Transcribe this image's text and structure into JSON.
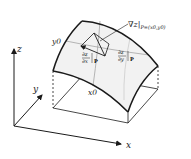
{
  "diagram": {
    "axes": {
      "x_label": "x",
      "y_label": "y",
      "z_label": "z"
    },
    "surface_labels": {
      "x0": "x0",
      "y0": "y0"
    },
    "annotations": {
      "gradient": "∇z|",
      "gradient_subscript": "P=(x0,y0)",
      "dzdx_num": "∂z",
      "dzdx_den": "∂x",
      "dzdy_num": "∂z",
      "dzdy_den": "∂y",
      "eval_at": "P"
    },
    "colors": {
      "line": "#1a1a1a",
      "surface_fill": "#f2f2f2",
      "grid_line": "#9a9a9a"
    }
  }
}
